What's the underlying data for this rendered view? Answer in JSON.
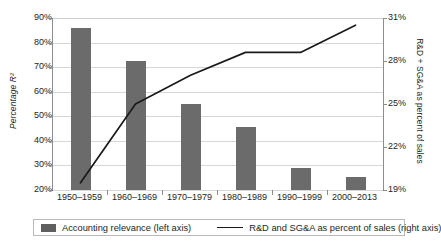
{
  "chart_data": {
    "type": "bar",
    "title": "",
    "xlabel": "",
    "categories": [
      "1950–1959",
      "1960–1969",
      "1970–1979",
      "1980–1989",
      "1990–1999",
      "2000–2013"
    ],
    "grid": true,
    "legend_position": "bottom",
    "series": [
      {
        "name": "Accounting relevance (left axis)",
        "type": "bar",
        "axis": "left",
        "color": "#6b6b6b",
        "unit": "%",
        "values": [
          86,
          72.5,
          55,
          45.5,
          29,
          25.5
        ]
      },
      {
        "name": "R&D and SG&A as percent of sales (right axis)",
        "type": "line",
        "axis": "right",
        "color": "#1a1a1a",
        "unit": "%",
        "values": [
          19.5,
          25,
          27,
          28.6,
          28.6,
          30.5
        ]
      }
    ],
    "left_axis": {
      "title": "Percentage R²",
      "ylim": [
        20,
        90
      ],
      "ticks": [
        "20%",
        "30%",
        "40%",
        "50%",
        "60%",
        "70%",
        "80%",
        "90%"
      ],
      "tick_values": [
        20,
        30,
        40,
        50,
        60,
        70,
        80,
        90
      ]
    },
    "right_axis": {
      "title": "R&D + SG&A as percent of sales",
      "ylim": [
        19,
        31
      ],
      "ticks": [
        "19%",
        "22%",
        "25%",
        "28%",
        "31%"
      ],
      "tick_values": [
        19,
        22,
        25,
        28,
        31
      ]
    }
  },
  "legend": {
    "bar_label": "Accounting relevance (left axis)",
    "line_label": "R&D and SG&A as percent of sales (right axis)"
  }
}
